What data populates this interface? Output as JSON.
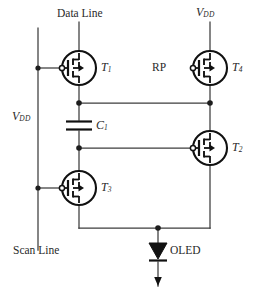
{
  "diagram": {
    "type": "schematic",
    "width": 254,
    "height": 290,
    "background_color": "#ffffff",
    "wire_color": "#3c3c3c",
    "symbol_color": "#111111"
  },
  "labels": {
    "data_line": "Data Line",
    "scan_line": "Scan Line",
    "vdd_top": "V",
    "vdd_top_sub": "DD",
    "vdd_left": "V",
    "vdd_left_sub": "DD",
    "rp": "RP",
    "oled": "OLED",
    "t1": "T",
    "t1_sub": "1",
    "t2": "T",
    "t2_sub": "2",
    "t3": "T",
    "t3_sub": "3",
    "t4": "T",
    "t4_sub": "4",
    "c1": "C",
    "c1_sub": "1"
  },
  "components": [
    {
      "id": "T1",
      "kind": "pmos-transistor",
      "label": "T1",
      "cx": 79,
      "cy": 68,
      "gate_side": "left",
      "drain_terminal": "Data Line",
      "source_terminal": "node-A"
    },
    {
      "id": "T4",
      "kind": "pmos-transistor",
      "label": "T4",
      "cx": 210,
      "cy": 68,
      "gate_side": "left",
      "gate_signal": "RP",
      "drain_terminal": "VDD",
      "source_terminal": "right-rail"
    },
    {
      "id": "T2",
      "kind": "pmos-transistor",
      "label": "T2",
      "cx": 210,
      "cy": 148,
      "gate_side": "left",
      "gate_terminal": "node-B",
      "drain_terminal": "right-rail",
      "source_terminal": "oled-anode"
    },
    {
      "id": "T3",
      "kind": "pmos-transistor",
      "label": "T3",
      "cx": 79,
      "cy": 188,
      "gate_side": "left",
      "gate_terminal": "Scan Line rail",
      "drain_terminal": "node-B",
      "source_terminal": "oled-anode"
    },
    {
      "id": "C1",
      "kind": "capacitor",
      "label": "C1",
      "cx": 79,
      "cy": 125,
      "top_terminal": "node-A",
      "bottom_terminal": "node-B"
    },
    {
      "id": "OLED",
      "kind": "diode-oled",
      "label": "OLED",
      "cx": 158,
      "cy": 254,
      "anode_terminal": "oled-anode",
      "cathode_terminal": "ground"
    }
  ],
  "nets": [
    {
      "name": "vdd-left-rail",
      "points": "38,28 38,250"
    },
    {
      "name": "data-line-stub",
      "points": "79,22 79,52"
    },
    {
      "name": "vdd-top-stub",
      "points": "210,22 210,52"
    },
    {
      "name": "node-A",
      "points": "79,84 79,103 210,103"
    },
    {
      "name": "right-rail",
      "points": "210,84 210,228"
    },
    {
      "name": "node-B",
      "points": "79,146 79,172 79,148 195,148"
    },
    {
      "name": "bottom-rail",
      "points": "79,204 79,228 210,228"
    },
    {
      "name": "oled-branch",
      "points": "158,228 158,285"
    }
  ],
  "junction_dots": [
    {
      "name": "t1-gate-tap",
      "x": 38,
      "y": 68
    },
    {
      "name": "t3-gate-tap",
      "x": 38,
      "y": 188
    },
    {
      "name": "node-a-left",
      "x": 79,
      "y": 103
    },
    {
      "name": "node-a-right",
      "x": 210,
      "y": 103
    },
    {
      "name": "node-b-left",
      "x": 79,
      "y": 148
    },
    {
      "name": "oled-anode",
      "x": 158,
      "y": 228
    }
  ]
}
